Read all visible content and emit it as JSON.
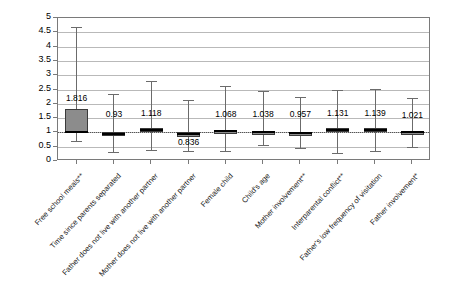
{
  "chart_data": {
    "type": "box",
    "title": "",
    "subtitle": "",
    "xlabel": "",
    "ylabel": "",
    "ylim": [
      0,
      5
    ],
    "ytick_step": 0.5,
    "yticks": [
      "5",
      "4.5",
      "4",
      "3.5",
      "3",
      "2.5",
      "2",
      "1.5",
      "1",
      "0.5",
      "0"
    ],
    "grid": true,
    "reference_line": 1,
    "legend": "none",
    "categories": [
      "Free school meals**",
      "Time since parents separated",
      "Father does not live with another partner",
      "Mother does not live with another partner",
      "Female child",
      "Child's age",
      "Mother involvement**",
      "Interparental conflict**",
      "Father's low frequency of visitation",
      "Father involvement*"
    ],
    "values": [
      1.816,
      0.93,
      1.118,
      0.836,
      1.068,
      1.038,
      0.957,
      1.131,
      1.139,
      1.021
    ],
    "value_labels": [
      "1.816",
      "0.93",
      "1.118",
      "0.836",
      "1.068",
      "1.038",
      "0.957",
      "1.131",
      "1.139",
      "1.021"
    ],
    "boxes": [
      {
        "category": "Free school meals**",
        "label": "1.816",
        "lower_whisker": 0.69,
        "box_low": 1.02,
        "median": 1.816,
        "box_high": 1.82,
        "upper_whisker": 4.68,
        "label_at": 2.02
      },
      {
        "category": "Time since parents separated",
        "label": "0.93",
        "lower_whisker": 0.32,
        "box_low": 0.93,
        "median": 0.93,
        "box_high": 0.99,
        "upper_whisker": 2.33,
        "label_at": 1.46
      },
      {
        "category": "Father does not live with another partner",
        "label": "1.118",
        "lower_whisker": 0.38,
        "box_low": 1.02,
        "median": 1.118,
        "box_high": 1.17,
        "upper_whisker": 2.79,
        "label_at": 1.49
      },
      {
        "category": "Mother does not live with another partner",
        "label": "0.836",
        "lower_whisker": 0.36,
        "box_low": 0.86,
        "median": 0.9,
        "box_high": 1.0,
        "upper_whisker": 2.12,
        "label_at": 0.5
      },
      {
        "category": "Female child",
        "label": "1.068",
        "lower_whisker": 0.35,
        "box_low": 1.01,
        "median": 1.068,
        "box_high": 1.1,
        "upper_whisker": 2.63,
        "label_at": 1.46
      },
      {
        "category": "Child's age",
        "label": "1.068",
        "lower_whisker": 0.56,
        "box_low": 1.0,
        "median": 1.068,
        "box_high": 1.07,
        "upper_whisker": 2.44,
        "label_at": 1.46
      },
      {
        "category": "Mother involvement**",
        "label": "1.038",
        "lower_whisker": 0.45,
        "box_low": 1.0,
        "median": 1.038,
        "box_high": 1.05,
        "upper_whisker": 2.38,
        "label_at": 1.46
      },
      {
        "category": "Interparental conflict**",
        "label": "0.957",
        "lower_whisker": 0.29,
        "box_low": 0.95,
        "median": 0.957,
        "box_high": 1.0,
        "upper_whisker": 2.22,
        "label_at": 1.46
      },
      {
        "category": "Father's low frequency of visitation",
        "label": "1.131",
        "lower_whisker": 0.34,
        "box_low": 1.04,
        "median": 1.131,
        "box_high": 1.18,
        "upper_whisker": 2.47,
        "label_at": 1.46
      },
      {
        "category": "Father involvement*",
        "label": "1.139",
        "lower_whisker": 0.37,
        "box_low": 1.05,
        "median": 1.139,
        "box_high": 1.19,
        "upper_whisker": 2.56,
        "label_at": 1.46
      }
    ],
    "note": "Box plot of odds ratios with confidence interval whiskers; reference line drawn at 1."
  },
  "axis": {
    "y_ticks": [
      "5",
      "4.5",
      "4",
      "3.5",
      "3",
      "2.5",
      "2",
      "1.5",
      "1",
      "0.5",
      "0"
    ]
  },
  "series": {
    "display_boxes": [
      {
        "label": "1.816",
        "lower_whisker": 0.69,
        "box_low": 1.02,
        "box_high": 1.82,
        "median": 1.02,
        "upper_whisker": 4.68,
        "label_y": 2.02
      },
      {
        "label": "0.93",
        "lower_whisker": 0.32,
        "box_low": 0.92,
        "box_high": 1.0,
        "median": 0.96,
        "upper_whisker": 2.33,
        "label_y": 1.46
      },
      {
        "label": "1.118",
        "lower_whisker": 0.38,
        "box_low": 1.01,
        "box_high": 1.14,
        "median": 1.08,
        "upper_whisker": 2.79,
        "label_y": 1.5
      },
      {
        "label": "0.836",
        "lower_whisker": 0.36,
        "box_low": 0.85,
        "box_high": 1.0,
        "median": 0.93,
        "upper_whisker": 2.12,
        "label_y": 0.5
      },
      {
        "label": "1.068",
        "lower_whisker": 0.35,
        "box_low": 1.0,
        "box_high": 1.09,
        "median": 1.05,
        "upper_whisker": 2.63,
        "label_y": 1.47
      },
      {
        "label": "1.038",
        "lower_whisker": 0.56,
        "box_low": 1.0,
        "box_high": 1.05,
        "median": 1.02,
        "upper_whisker": 2.44,
        "label_y": 1.47
      },
      {
        "label": "0.957",
        "lower_whisker": 0.45,
        "box_low": 0.96,
        "box_high": 1.01,
        "median": 0.98,
        "upper_whisker": 2.25,
        "label_y": 1.47
      },
      {
        "label": "1.131",
        "lower_whisker": 0.29,
        "box_low": 1.02,
        "box_high": 1.15,
        "median": 1.08,
        "upper_whisker": 2.47,
        "label_y": 1.5
      },
      {
        "label": "1.139",
        "lower_whisker": 0.34,
        "box_low": 1.03,
        "box_high": 1.16,
        "median": 1.09,
        "upper_whisker": 2.52,
        "label_y": 1.5
      },
      {
        "label": "1.021",
        "lower_whisker": 0.48,
        "box_low": 1.0,
        "box_high": 1.04,
        "median": 1.02,
        "upper_whisker": 2.22,
        "label_y": 1.44
      }
    ]
  }
}
